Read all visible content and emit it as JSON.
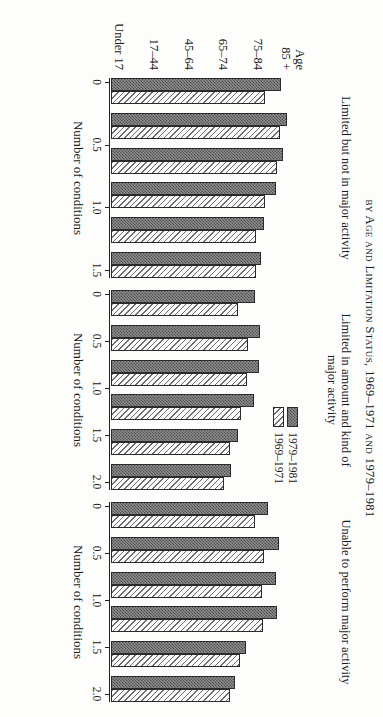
{
  "figure": {
    "title": "by Age and Limitation Status, 1969–1971 and 1979–1981",
    "axis_title": "Number of conditions"
  },
  "legend": {
    "position": "middle-panel-right",
    "items": [
      {
        "label": "1979–1981",
        "pattern": "dark-checker",
        "color": "#8e8e8e"
      },
      {
        "label": "1969–1971",
        "pattern": "light-diagonal-hatch",
        "color": "#fbfbfb"
      }
    ]
  },
  "categories": [
    "Age\n85 +",
    "75–84",
    "65–74",
    "45–64",
    "17–44",
    "Under 17"
  ],
  "category_labels": [
    {
      "line1": "Age",
      "line2": "85 +"
    },
    {
      "line1": "75–84",
      "line2": ""
    },
    {
      "line1": "65–74",
      "line2": ""
    },
    {
      "line1": "45–64",
      "line2": ""
    },
    {
      "line1": "17–44",
      "line2": ""
    },
    {
      "line1": "Under 17",
      "line2": ""
    }
  ],
  "panels": [
    {
      "title": "Limited but not in major activity",
      "ticks": [
        "0",
        "0.5",
        "1.0",
        "1.5"
      ],
      "tick_values": [
        0,
        0.5,
        1.0,
        1.5
      ]
    },
    {
      "title": "Limited in amount and kind of\nmajor activity",
      "title_line1": "Limited in amount and kind of",
      "title_line2": "major activity",
      "ticks": [
        "0",
        "0.5",
        "1.0",
        "1.5",
        "2.0"
      ],
      "tick_values": [
        0,
        0.5,
        1.0,
        1.5,
        2.0
      ]
    },
    {
      "title": "Unable to perform major activity",
      "ticks": [
        "0",
        "0.5",
        "1.0",
        "1.5",
        "2.0"
      ],
      "tick_values": [
        0,
        0.5,
        1.0,
        1.5,
        2.0
      ]
    }
  ],
  "chart_data": [
    {
      "type": "bar",
      "title": "Limited but not in major activity",
      "xlabel": "Number of conditions",
      "ylabel": "",
      "categories": [
        "Age 85 +",
        "75–84",
        "65–74",
        "45–64",
        "17–44",
        "Under 17"
      ],
      "series": [
        {
          "name": "1979–1981",
          "values": [
            1.3,
            1.35,
            1.32,
            1.26,
            1.17,
            1.15
          ]
        },
        {
          "name": "1969–1971",
          "values": [
            1.18,
            1.29,
            1.27,
            1.18,
            1.11,
            1.11
          ]
        }
      ],
      "xlim": [
        0,
        1.5
      ],
      "ticks": [
        0,
        0.5,
        1.0,
        1.5
      ],
      "grid": false,
      "legend": "none"
    },
    {
      "type": "bar",
      "title": "Limited in amount and kind of major activity",
      "xlabel": "Number of conditions",
      "ylabel": "",
      "categories": [
        "Age 85 +",
        "75–84",
        "65–74",
        "45–64",
        "17–44",
        "Under 17"
      ],
      "series": [
        {
          "name": "1979–1981",
          "values": [
            1.47,
            1.52,
            1.51,
            1.46,
            1.3,
            1.22
          ]
        },
        {
          "name": "1969–1971",
          "values": [
            1.3,
            1.4,
            1.39,
            1.33,
            1.21,
            1.15
          ]
        }
      ],
      "xlim": [
        0,
        2.0
      ],
      "ticks": [
        0,
        0.5,
        1.0,
        1.5,
        2.0
      ],
      "grid": false,
      "legend": "right"
    },
    {
      "type": "bar",
      "title": "Unable to perform major activity",
      "xlabel": "Number of conditions",
      "ylabel": "",
      "categories": [
        "Age 85 +",
        "75–84",
        "65–74",
        "45–64",
        "17–44",
        "Under 17"
      ],
      "series": [
        {
          "name": "1979–1981",
          "values": [
            1.6,
            1.71,
            1.68,
            1.69,
            1.38,
            1.27
          ]
        },
        {
          "name": "1969–1971",
          "values": [
            1.47,
            1.56,
            1.54,
            1.55,
            1.32,
            1.21
          ]
        }
      ],
      "xlim": [
        0,
        2.0
      ],
      "ticks": [
        0,
        0.5,
        1.0,
        1.5,
        2.0
      ],
      "grid": false,
      "legend": "none"
    }
  ]
}
